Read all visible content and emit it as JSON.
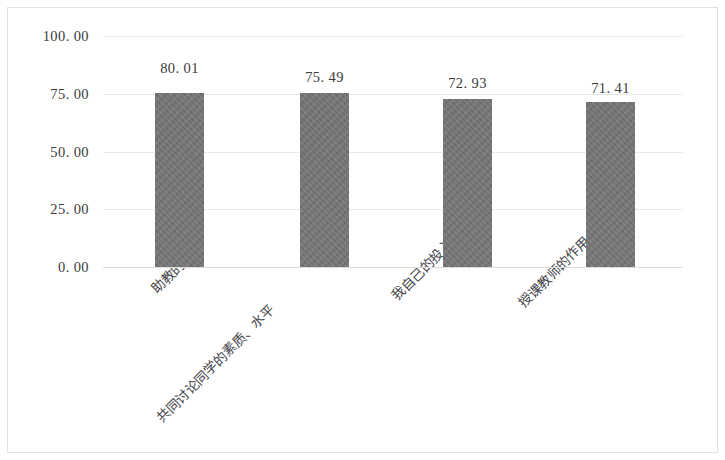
{
  "chart_data": {
    "type": "bar",
    "title": "",
    "subtitle": "",
    "xlabel": "",
    "ylabel": "",
    "categories": [
      "助教的工作",
      "共同讨论同学的素质、水平",
      "我自己的投入",
      "授课教师的作用"
    ],
    "values": [
      80.01,
      75.49,
      72.93,
      71.41
    ],
    "value_labels": [
      "80. 01",
      "75. 49",
      "72. 93",
      "71. 41"
    ],
    "bar_draw_values": [
      75.3,
      75.3,
      72.93,
      71.41
    ],
    "ylim": [
      0,
      100
    ],
    "ytick_values": [
      100,
      75,
      50,
      25,
      0
    ],
    "ytick_labels": [
      "100. 00",
      "75. 00",
      "50. 00",
      "25. 00",
      "0. 00"
    ],
    "grid": "horizontal",
    "legend": "none",
    "series": [
      {
        "name": "",
        "values": [
          80.01,
          75.49,
          72.93,
          71.41
        ]
      }
    ]
  },
  "style": {
    "bar_color": "#767676",
    "grid_color": "#e9e9e9",
    "text_color": "#3b3b3b",
    "background": "#ffffff",
    "border_color": "#e2e2e2"
  }
}
